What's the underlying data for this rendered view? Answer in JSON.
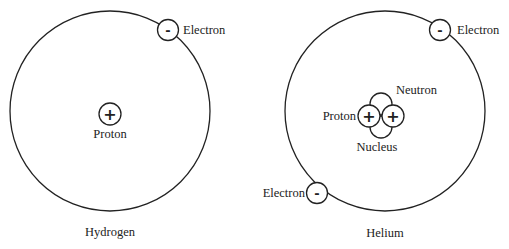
{
  "atoms": [
    {
      "name": "Hydrogen",
      "labels": {
        "electron": "Electron",
        "proton": "Proton",
        "title": "Hydrogen"
      },
      "symbols": {
        "proton": "+",
        "electron": "-"
      }
    },
    {
      "name": "Helium",
      "labels": {
        "electron_top": "Electron",
        "electron_bottom": "Electron",
        "proton": "Proton",
        "neutron": "Neutron",
        "nucleus": "Nucleus",
        "title": "Helium"
      },
      "symbols": {
        "proton": "+",
        "electron": "-"
      }
    }
  ],
  "colors": {
    "stroke": "#222222",
    "background": "#ffffff"
  }
}
